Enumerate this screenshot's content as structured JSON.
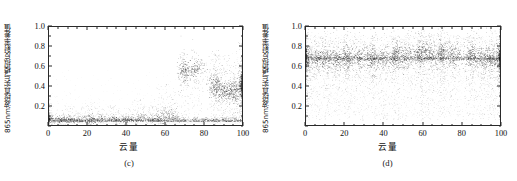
{
  "figure": {
    "background": "#ffffff",
    "point_color": "#1a1a1a"
  },
  "panels": [
    {
      "id": "c",
      "panel_label": "(c)",
      "ylabel": "865nm波段真实与模拟反射率差值",
      "xlabel": "云量"
    },
    {
      "id": "d",
      "panel_label": "(d)",
      "ylabel": "865nm波段真实与模拟反射率差值",
      "xlabel": "云量"
    }
  ],
  "chart_data": [
    {
      "type": "scatter",
      "title": "(c)",
      "xlabel": "云量",
      "ylabel": "865nm波段真实与模拟反射率差值",
      "xlim": [
        0,
        100
      ],
      "ylim": [
        0.0,
        1.0
      ],
      "xticks": [
        0,
        20,
        40,
        60,
        80,
        100
      ],
      "yticks": [
        0.2,
        0.4,
        0.6,
        0.8,
        1.0
      ],
      "ytick_labels": [
        "0.2",
        "0.4",
        "0.6",
        "0.8",
        "1.0"
      ],
      "xtick_labels": [
        "0",
        "20",
        "40",
        "60",
        "80",
        "100"
      ],
      "grid": false,
      "legend": "none",
      "description": "Dense low band of points near 0.02-0.15 across all cloud amounts, with vertical clusters; tall high-value clusters near cloud amount 70 and 85-100 reaching 0.6-0.85",
      "clusters": [
        {
          "x": 0,
          "spread": 1.2,
          "n": 160,
          "y_low": 0.02,
          "y_high": 0.3,
          "y_dense": 0.06
        },
        {
          "x": 5,
          "spread": 2.0,
          "n": 90,
          "y_low": 0.02,
          "y_high": 0.16,
          "y_dense": 0.05
        },
        {
          "x": 10,
          "spread": 2.0,
          "n": 110,
          "y_low": 0.02,
          "y_high": 0.2,
          "y_dense": 0.06
        },
        {
          "x": 15,
          "spread": 1.6,
          "n": 70,
          "y_low": 0.02,
          "y_high": 0.14,
          "y_dense": 0.05
        },
        {
          "x": 21,
          "spread": 1.8,
          "n": 130,
          "y_low": 0.02,
          "y_high": 0.24,
          "y_dense": 0.06
        },
        {
          "x": 26,
          "spread": 2.0,
          "n": 95,
          "y_low": 0.02,
          "y_high": 0.2,
          "y_dense": 0.06
        },
        {
          "x": 34,
          "spread": 1.8,
          "n": 105,
          "y_low": 0.02,
          "y_high": 0.22,
          "y_dense": 0.06
        },
        {
          "x": 41,
          "spread": 1.8,
          "n": 85,
          "y_low": 0.02,
          "y_high": 0.18,
          "y_dense": 0.06
        },
        {
          "x": 47,
          "spread": 2.0,
          "n": 100,
          "y_low": 0.02,
          "y_high": 0.28,
          "y_dense": 0.07
        },
        {
          "x": 53,
          "spread": 1.8,
          "n": 90,
          "y_low": 0.02,
          "y_high": 0.2,
          "y_dense": 0.06
        },
        {
          "x": 59,
          "spread": 2.0,
          "n": 150,
          "y_low": 0.02,
          "y_high": 0.42,
          "y_dense": 0.08
        },
        {
          "x": 64,
          "spread": 1.8,
          "n": 120,
          "y_low": 0.02,
          "y_high": 0.36,
          "y_dense": 0.08
        },
        {
          "x": 70,
          "spread": 1.6,
          "n": 240,
          "y_low": 0.02,
          "y_high": 0.66,
          "y_dense": 0.55
        },
        {
          "x": 76,
          "spread": 2.4,
          "n": 230,
          "y_low": 0.02,
          "y_high": 0.68,
          "y_dense": 0.58
        },
        {
          "x": 86,
          "spread": 1.6,
          "n": 300,
          "y_low": 0.02,
          "y_high": 0.74,
          "y_dense": 0.4
        },
        {
          "x": 91,
          "spread": 2.4,
          "n": 300,
          "y_low": 0.02,
          "y_high": 0.72,
          "y_dense": 0.35
        },
        {
          "x": 96,
          "spread": 2.0,
          "n": 300,
          "y_low": 0.02,
          "y_high": 0.74,
          "y_dense": 0.35
        },
        {
          "x": 100,
          "spread": 0.9,
          "n": 420,
          "y_low": 0.02,
          "y_high": 0.88,
          "y_dense": 0.4
        }
      ]
    },
    {
      "type": "scatter",
      "title": "(d)",
      "xlabel": "云量",
      "ylabel": "865nm波段真实与模拟反射率差值",
      "xlim": [
        0,
        100
      ],
      "ylim": [
        0.0,
        1.0
      ],
      "xticks": [
        0,
        20,
        40,
        60,
        80,
        100
      ],
      "yticks": [
        0.2,
        0.4,
        0.6,
        0.8,
        1.0
      ],
      "ytick_labels": [
        "0.2",
        "0.4",
        "0.6",
        "0.8",
        "1.0"
      ],
      "xtick_labels": [
        "0",
        "20",
        "40",
        "60",
        "80",
        "100"
      ],
      "grid": false,
      "legend": "none",
      "dense_band_y": 0.68,
      "description": "Points spread over full 0.05-0.95 range with a strong dense horizontal band at about 0.68 spanning all cloud amounts; vertical clusters at regular cloud-amount intervals",
      "clusters": [
        {
          "x": 0,
          "spread": 1.2,
          "n": 420,
          "y_low": 0.05,
          "y_high": 0.95,
          "y_dense": 0.68
        },
        {
          "x": 5,
          "spread": 2.4,
          "n": 300,
          "y_low": 0.05,
          "y_high": 0.92,
          "y_dense": 0.68
        },
        {
          "x": 11,
          "spread": 2.4,
          "n": 300,
          "y_low": 0.05,
          "y_high": 0.92,
          "y_dense": 0.68
        },
        {
          "x": 16,
          "spread": 1.6,
          "n": 180,
          "y_low": 0.05,
          "y_high": 0.88,
          "y_dense": 0.68
        },
        {
          "x": 21,
          "spread": 1.6,
          "n": 320,
          "y_low": 0.05,
          "y_high": 0.92,
          "y_dense": 0.68
        },
        {
          "x": 27,
          "spread": 2.4,
          "n": 280,
          "y_low": 0.05,
          "y_high": 0.9,
          "y_dense": 0.68
        },
        {
          "x": 34,
          "spread": 1.8,
          "n": 300,
          "y_low": 0.05,
          "y_high": 0.92,
          "y_dense": 0.68
        },
        {
          "x": 40,
          "spread": 2.4,
          "n": 280,
          "y_low": 0.05,
          "y_high": 0.9,
          "y_dense": 0.68
        },
        {
          "x": 46,
          "spread": 1.6,
          "n": 320,
          "y_low": 0.05,
          "y_high": 0.92,
          "y_dense": 0.7
        },
        {
          "x": 52,
          "spread": 2.4,
          "n": 300,
          "y_low": 0.05,
          "y_high": 0.9,
          "y_dense": 0.7
        },
        {
          "x": 59,
          "spread": 1.6,
          "n": 360,
          "y_low": 0.05,
          "y_high": 0.92,
          "y_dense": 0.72
        },
        {
          "x": 64,
          "spread": 2.2,
          "n": 300,
          "y_low": 0.05,
          "y_high": 0.9,
          "y_dense": 0.72
        },
        {
          "x": 70,
          "spread": 1.6,
          "n": 360,
          "y_low": 0.05,
          "y_high": 0.92,
          "y_dense": 0.72
        },
        {
          "x": 76,
          "spread": 2.6,
          "n": 320,
          "y_low": 0.05,
          "y_high": 0.9,
          "y_dense": 0.7
        },
        {
          "x": 85,
          "spread": 1.6,
          "n": 340,
          "y_low": 0.05,
          "y_high": 0.92,
          "y_dense": 0.7
        },
        {
          "x": 91,
          "spread": 2.4,
          "n": 300,
          "y_low": 0.05,
          "y_high": 0.9,
          "y_dense": 0.68
        },
        {
          "x": 96,
          "spread": 2.0,
          "n": 280,
          "y_low": 0.05,
          "y_high": 0.9,
          "y_dense": 0.68
        },
        {
          "x": 100,
          "spread": 0.9,
          "n": 420,
          "y_low": 0.05,
          "y_high": 0.95,
          "y_dense": 0.68
        }
      ]
    }
  ]
}
